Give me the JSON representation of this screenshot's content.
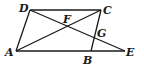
{
  "diagram": {
    "points": {
      "A": {
        "label": "A",
        "x": 16,
        "y": 51
      },
      "B": {
        "label": "B",
        "x": 91,
        "y": 51
      },
      "C": {
        "label": "C",
        "x": 101,
        "y": 10
      },
      "D": {
        "label": "D",
        "x": 30,
        "y": 10
      },
      "E": {
        "label": "E",
        "x": 125,
        "y": 51
      },
      "F": {
        "label": "F",
        "x": 67.5,
        "y": 26.2
      },
      "G": {
        "label": "G",
        "x": 94.2,
        "y": 37.7
      }
    },
    "segments": [
      "AB",
      "BE",
      "DC",
      "AD",
      "BC",
      "AC",
      "DE"
    ],
    "labels": {
      "A": "A",
      "B": "B",
      "C": "C",
      "D": "D",
      "E": "E",
      "F": "F",
      "G": "G"
    }
  }
}
